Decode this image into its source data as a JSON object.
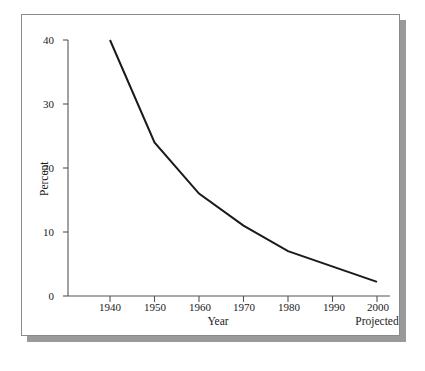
{
  "figure": {
    "background_color": "#ffffff",
    "frame_border_color": "#8a8a8a",
    "shadow_color": "#9a9a9a"
  },
  "chart_data": {
    "type": "line",
    "title": "",
    "subtitle": "",
    "xlabel": "Year",
    "ylabel": "Percent",
    "x": [
      1940,
      1950,
      1960,
      1970,
      1980,
      2000
    ],
    "values": [
      40,
      24,
      16,
      11,
      7,
      2.2
    ],
    "series": [
      {
        "name": "Percent",
        "x": [
          1940,
          1950,
          1960,
          1970,
          1980,
          2000
        ],
        "values": [
          40,
          24,
          16,
          11,
          7,
          2.2
        ],
        "color": "#1a1a1a",
        "line_width": 2
      }
    ],
    "xlim": [
      1935,
      2005
    ],
    "ylim": [
      0,
      40
    ],
    "x_tick_labels": [
      "1940",
      "1950",
      "1960",
      "1970",
      "1980",
      "1990",
      "2000"
    ],
    "x_tick_values": [
      1940,
      1950,
      1960,
      1970,
      1980,
      1990,
      2000
    ],
    "y_tick_labels": [
      "0",
      "10",
      "20",
      "30",
      "40"
    ],
    "y_tick_values": [
      0,
      10,
      20,
      30,
      40
    ],
    "grid": false,
    "legend": "none",
    "annotations": [
      {
        "text": "Projected",
        "x": 2000,
        "position": "below-axis-right"
      }
    ]
  },
  "axis": {
    "y_title": "Percent",
    "x_title": "Year",
    "projected_note": "Projected",
    "y_ticks": [
      "40",
      "30",
      "20",
      "10",
      "0"
    ],
    "x_ticks": [
      "1940",
      "1950",
      "1960",
      "1970",
      "1980",
      "1990",
      "2000"
    ]
  }
}
